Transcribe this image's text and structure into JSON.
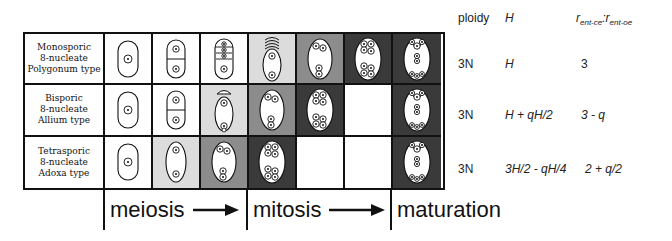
{
  "figure": {
    "rows": [
      {
        "label_lines": [
          "Monosporic",
          "8-nucleate",
          "Polygonum type"
        ],
        "stages": [
          {
            "shade": "#ffffff",
            "sac": "1n"
          },
          {
            "shade": "#ffffff",
            "sac": "2n-wall"
          },
          {
            "shade": "#ffffff",
            "sac": "tetrad"
          },
          {
            "shade": "#dcdcdc",
            "sac": "1+1-degen"
          },
          {
            "shade": "#8c8c8c",
            "sac": "2+2"
          },
          {
            "shade": "#3a3a3a",
            "sac": "4+4"
          },
          {
            "shade": "#3a3a3a",
            "sac": "mature"
          }
        ]
      },
      {
        "label_lines": [
          "Bisporic",
          "8-nucleate",
          "Allium type"
        ],
        "stages": [
          {
            "shade": "#ffffff",
            "sac": "1n"
          },
          {
            "shade": "#ffffff",
            "sac": "2n-wall"
          },
          {
            "shade": "#dcdcdc",
            "sac": "1+1-degen-top"
          },
          {
            "shade": "#8c8c8c",
            "sac": "2+2"
          },
          {
            "shade": "#3a3a3a",
            "sac": "4+4"
          },
          {
            "shade": "#ffffff",
            "sac": "empty"
          },
          {
            "shade": "#3a3a3a",
            "sac": "mature"
          }
        ]
      },
      {
        "label_lines": [
          "Tetrasporic",
          "8-nucleate",
          "Adoxa type"
        ],
        "stages": [
          {
            "shade": "#ffffff",
            "sac": "1n"
          },
          {
            "shade": "#dcdcdc",
            "sac": "2n"
          },
          {
            "shade": "#8c8c8c",
            "sac": "2+2"
          },
          {
            "shade": "#3a3a3a",
            "sac": "4+4"
          },
          {
            "shade": "#ffffff",
            "sac": "empty"
          },
          {
            "shade": "#ffffff",
            "sac": "empty"
          },
          {
            "shade": "#3a3a3a",
            "sac": "mature"
          }
        ]
      }
    ],
    "phases": [
      {
        "label": "meiosis",
        "arrow": true
      },
      {
        "label": "mitosis",
        "arrow": true
      },
      {
        "label": "maturation",
        "arrow": false
      }
    ]
  },
  "table": {
    "headers": {
      "ploidy": "ploidy",
      "H": "H",
      "ratio_r1": "r",
      "ratio_sub1": "ent-ce",
      "ratio_sep": ":",
      "ratio_r2": "r",
      "ratio_sub2": "ent-oe"
    },
    "rows": [
      {
        "ploidy": "3N",
        "H": "H",
        "ratio": "3"
      },
      {
        "ploidy": "3N",
        "H": "H + qH/2",
        "ratio": "3 - q"
      },
      {
        "ploidy": "3N",
        "H": "3H/2 - qH/4",
        "ratio": "2 + q/2"
      }
    ]
  }
}
